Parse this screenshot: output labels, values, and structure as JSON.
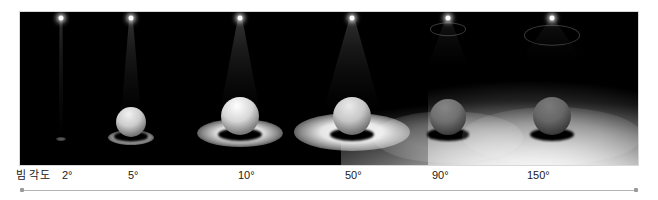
{
  "figure": {
    "caption_label": "빔 각도",
    "axis_label_left_cap": "axis-start-marker",
    "axis_label_right_cap": "axis-end-marker",
    "panel_background": "#000000",
    "page_background": "#ffffff",
    "text_color": "#202020",
    "axis_color": "#b4b4b4"
  },
  "chart_data": {
    "type": "table",
    "title": "빔 각도",
    "xlabel": "빔 각도",
    "ylabel": "",
    "categories": [
      "2°",
      "5°",
      "10°",
      "50°",
      "90°",
      "150°"
    ],
    "values": [
      2,
      5,
      10,
      50,
      90,
      150
    ],
    "series": [
      {
        "name": "beam_angle_degrees",
        "values": [
          2,
          5,
          10,
          50,
          90,
          150
        ]
      },
      {
        "name": "relative_pool_width",
        "values": [
          0.03,
          0.09,
          0.3,
          0.78,
          1.0,
          1.0
        ]
      },
      {
        "name": "relative_center_intensity",
        "values": [
          1.0,
          0.92,
          0.8,
          0.58,
          0.3,
          0.22
        ]
      }
    ],
    "legend_position": "none",
    "grid": false,
    "annotations": [
      "Narrow beams concentrate light into a tight bright spot.",
      "Wide beams spread light broadly with lower intensity."
    ]
  },
  "scenes": [
    {
      "id": "scene-2deg",
      "angle_label": "2°",
      "angle_value": 2,
      "caption_x": 62,
      "scene_left": 26,
      "scene_width": 70,
      "cone_top_width": 3,
      "cone_bottom_width": 5,
      "cone_height": 118,
      "cone_opacity": 0.55,
      "sphere_size": 0,
      "sphere_left": 35,
      "sphere_bottom": 26,
      "sphere_brightness": 0.0,
      "pool_width": 10,
      "pool_height": 4,
      "pool_bottom": 24,
      "pool_opacity": 0.35,
      "fixture_ring_size": 0
    },
    {
      "id": "scene-5deg",
      "angle_label": "5°",
      "angle_value": 5,
      "caption_x": 128,
      "scene_left": 88,
      "scene_width": 86,
      "cone_top_width": 4,
      "cone_bottom_width": 20,
      "cone_height": 96,
      "cone_opacity": 0.62,
      "sphere_size": 30,
      "sphere_left": 40,
      "sphere_bottom": 28,
      "sphere_brightness": 0.95,
      "pool_width": 46,
      "pool_height": 15,
      "pool_bottom": 20,
      "pool_opacity": 0.9,
      "fixture_ring_size": 0
    },
    {
      "id": "scene-10deg",
      "angle_label": "10°",
      "angle_value": 10,
      "caption_x": 238,
      "scene_left": 186,
      "scene_width": 108,
      "cone_top_width": 5,
      "cone_bottom_width": 40,
      "cone_height": 92,
      "cone_opacity": 0.66,
      "sphere_size": 38,
      "sphere_left": 46,
      "sphere_bottom": 30,
      "sphere_brightness": 1.0,
      "pool_width": 86,
      "pool_height": 28,
      "pool_bottom": 18,
      "pool_opacity": 0.96,
      "fixture_ring_size": 0
    },
    {
      "id": "scene-50deg",
      "angle_label": "50°",
      "angle_value": 50,
      "caption_x": 345,
      "scene_left": 292,
      "scene_width": 120,
      "cone_top_width": 6,
      "cone_bottom_width": 56,
      "cone_height": 88,
      "cone_opacity": 0.6,
      "sphere_size": 38,
      "sphere_left": 48,
      "sphere_bottom": 30,
      "sphere_brightness": 0.92,
      "pool_width": 116,
      "pool_height": 38,
      "pool_bottom": 14,
      "pool_opacity": 0.98,
      "fixture_ring_size": 0
    },
    {
      "id": "scene-90deg",
      "angle_label": "90°",
      "angle_value": 90,
      "caption_x": 432,
      "scene_left": 396,
      "scene_width": 104,
      "cone_top_width": 6,
      "cone_bottom_width": 40,
      "cone_height": 46,
      "cone_opacity": 0.3,
      "sphere_size": 36,
      "sphere_left": 34,
      "sphere_bottom": 30,
      "sphere_brightness": 0.52,
      "pool_width": 150,
      "pool_height": 52,
      "pool_bottom": 2,
      "pool_opacity": 0.3,
      "fixture_ring_size": 34
    },
    {
      "id": "scene-150deg",
      "angle_label": "150°",
      "angle_value": 150,
      "caption_x": 527,
      "scene_left": 492,
      "scene_width": 120,
      "cone_top_width": 6,
      "cone_bottom_width": 60,
      "cone_height": 40,
      "cone_opacity": 0.26,
      "sphere_size": 38,
      "sphere_left": 36,
      "sphere_bottom": 30,
      "sphere_brightness": 0.48,
      "pool_width": 180,
      "pool_height": 58,
      "pool_bottom": 0,
      "pool_opacity": 0.26,
      "fixture_ring_size": 54
    }
  ]
}
